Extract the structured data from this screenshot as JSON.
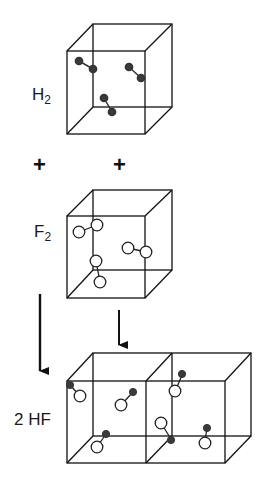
{
  "diagram": {
    "type": "reaction-schematic",
    "reaction": "H2 + F2 -> 2 HF",
    "reactants": [
      {
        "label_main": "H",
        "label_sub": "2",
        "molecule_count": 3,
        "atom_style": "filled small"
      },
      {
        "label_main": "F",
        "label_sub": "2",
        "molecule_count": 3,
        "atom_style": "open large"
      }
    ],
    "operators": {
      "plus_left": "+",
      "plus_right": "+"
    },
    "product": {
      "label": "2 HF",
      "molecule_count": 6,
      "atom_style": "filled small + open large",
      "container": "two adjoined cubes"
    },
    "colors": {
      "line": "#111111",
      "filled_atom": "#333333",
      "open_atom_fill": "#ffffff",
      "background": "#ffffff"
    }
  }
}
